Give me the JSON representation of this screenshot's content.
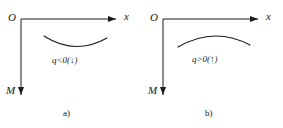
{
  "figure": {
    "background_color": "#ffffff",
    "stroke_color": "#1a1a1a"
  },
  "panels": [
    {
      "id": "a",
      "caption": "a)",
      "origin_label": "O",
      "x_axis_label": "x",
      "moment_axis_label": "M",
      "load_label": "q<0(↓)",
      "curve_shape": "concave-up"
    },
    {
      "id": "b",
      "caption": "b)",
      "origin_label": "O",
      "x_axis_label": "x",
      "moment_axis_label": "M",
      "load_label": "q>0(↑)",
      "curve_shape": "concave-down"
    }
  ]
}
